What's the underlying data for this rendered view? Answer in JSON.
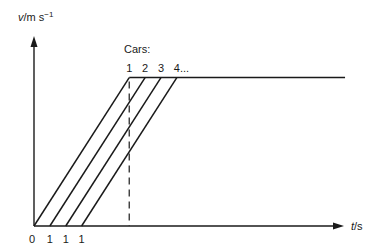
{
  "diagram": {
    "y_axis_label": {
      "var": "v",
      "unit": "/m s",
      "exp": "−1"
    },
    "x_axis_label": {
      "var": "t",
      "unit": "/s"
    },
    "cars_label": "Cars:",
    "car_numbers": [
      "1",
      "2",
      "3",
      "4..."
    ],
    "x_tick_labels": [
      "0",
      "1",
      "1",
      "1"
    ]
  },
  "chart_data": {
    "type": "line",
    "title": "",
    "xlabel": "t/s",
    "ylabel": "v/m s^-1",
    "series": [
      {
        "name": "Car 1",
        "start_t": 0,
        "t_reach_max": 6,
        "v_max": 1
      },
      {
        "name": "Car 2",
        "start_t": 1,
        "t_reach_max": 7,
        "v_max": 1
      },
      {
        "name": "Car 3",
        "start_t": 2,
        "t_reach_max": 8,
        "v_max": 1
      },
      {
        "name": "Car 4",
        "start_t": 3,
        "t_reach_max": 9,
        "v_max": 1
      }
    ],
    "plateau_end_t": 19.6,
    "dashed_marker_t": 6,
    "xlim": [
      0,
      20
    ],
    "ylim": [
      0,
      1.28
    ],
    "grid": false
  }
}
